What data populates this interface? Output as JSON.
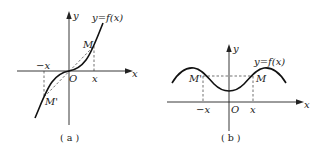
{
  "figures": [
    {
      "id": "a",
      "caption": "( a )",
      "function_label": "y=f(x)",
      "axis_x_label": "x",
      "axis_y_label": "y",
      "origin_label": "O",
      "point_label": "M",
      "mirror_point_label": "M'",
      "tick_pos_label": "x",
      "tick_neg_label": "−x",
      "symmetry": "odd (symmetric about origin)"
    },
    {
      "id": "b",
      "caption": "( b )",
      "function_label": "y=f(x)",
      "axis_x_label": "x",
      "axis_y_label": "y",
      "origin_label": "O",
      "point_label": "M",
      "mirror_point_label": "M'",
      "tick_pos_label": "x",
      "tick_neg_label": "−x",
      "symmetry": "even (symmetric about y-axis)"
    }
  ]
}
